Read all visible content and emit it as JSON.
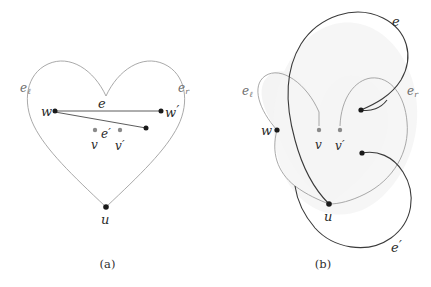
{
  "figure": {
    "type": "mathematical-diagram",
    "background_color": "#ffffff"
  },
  "colors": {
    "heart_curve": "#9a9a9a",
    "dark_curve": "#3a3a3a",
    "edge_line": "#4a4a4a",
    "vertex_black": "#1a1a1a",
    "vertex_gray": "#8a8a8a",
    "shaded_region": "#f4f4f4",
    "label_text": "#2b2b2b",
    "label_gray": "#6e6e6e",
    "caption_text": "#303030"
  },
  "panels": [
    {
      "id": "a",
      "caption": "(a)",
      "vertices": [
        {
          "name": "w",
          "label": "w",
          "sub": "",
          "prime": false,
          "color": "black",
          "x": 55,
          "y": 111
        },
        {
          "name": "w-prime",
          "label": "w",
          "sub": "",
          "prime": true,
          "color": "black",
          "x": 161,
          "y": 111
        },
        {
          "name": "v",
          "label": "v",
          "sub": "",
          "prime": false,
          "color": "gray",
          "x": 95,
          "y": 130
        },
        {
          "name": "v-prime",
          "label": "v",
          "sub": "",
          "prime": true,
          "color": "gray",
          "x": 120,
          "y": 130
        },
        {
          "name": "u",
          "label": "u",
          "sub": "",
          "prime": false,
          "color": "black",
          "x": 106,
          "y": 207
        },
        {
          "name": "e-prime-endpoint",
          "label": "",
          "sub": "",
          "prime": false,
          "color": "black",
          "x": 146,
          "y": 128
        }
      ],
      "edges": [
        {
          "name": "e",
          "label": "e",
          "prime": false,
          "from": "w",
          "to": "w-prime"
        },
        {
          "name": "e-prime",
          "label": "e",
          "prime": true,
          "from": "w",
          "to": "e-prime-endpoint"
        }
      ],
      "labels": [
        {
          "name": "label-e-left",
          "text": "e",
          "sub": "ℓ",
          "prime": false,
          "x": 20,
          "y": 82,
          "gray": true
        },
        {
          "name": "label-e-right",
          "text": "e",
          "sub": "r",
          "prime": false,
          "x": 178,
          "y": 82,
          "gray": true
        },
        {
          "name": "label-e",
          "text": "e",
          "sub": "",
          "prime": false,
          "x": 98,
          "y": 97,
          "gray": false
        },
        {
          "name": "label-e-prime",
          "text": "e",
          "sub": "",
          "prime": true,
          "x": 101,
          "y": 127,
          "gray": false
        },
        {
          "name": "label-w",
          "text": "w",
          "sub": "",
          "prime": false,
          "x": 41,
          "y": 105,
          "gray": false
        },
        {
          "name": "label-w-prime",
          "text": "w",
          "sub": "",
          "prime": true,
          "x": 165,
          "y": 105,
          "gray": false
        },
        {
          "name": "label-v",
          "text": "v",
          "sub": "",
          "prime": false,
          "x": 91,
          "y": 139,
          "gray": false
        },
        {
          "name": "label-v-prime",
          "text": "v",
          "sub": "",
          "prime": true,
          "x": 115,
          "y": 139,
          "gray": false
        },
        {
          "name": "label-u",
          "text": "u",
          "sub": "",
          "prime": false,
          "x": 101,
          "y": 213,
          "gray": false
        }
      ]
    },
    {
      "id": "b",
      "caption": "(b)",
      "vertices": [
        {
          "name": "w",
          "label": "w",
          "sub": "",
          "prime": false,
          "color": "black",
          "x": 62,
          "y": 130
        },
        {
          "name": "v",
          "label": "v",
          "sub": "",
          "prime": false,
          "color": "gray",
          "x": 104,
          "y": 130
        },
        {
          "name": "v-prime",
          "label": "v",
          "sub": "",
          "prime": true,
          "color": "gray",
          "x": 125,
          "y": 130
        },
        {
          "name": "u",
          "label": "u",
          "sub": "",
          "prime": false,
          "color": "black",
          "x": 114,
          "y": 204
        },
        {
          "name": "e-endpoint",
          "label": "",
          "sub": "",
          "prime": false,
          "color": "black",
          "x": 146,
          "y": 110
        },
        {
          "name": "e-prime-endpoint",
          "label": "",
          "sub": "",
          "prime": false,
          "color": "black",
          "x": 147,
          "y": 153
        }
      ],
      "labels": [
        {
          "name": "label-e-left",
          "text": "e",
          "sub": "ℓ",
          "prime": false,
          "x": 27,
          "y": 85,
          "gray": true
        },
        {
          "name": "label-e-right",
          "text": "e",
          "sub": "r",
          "prime": false,
          "x": 192,
          "y": 85,
          "gray": true
        },
        {
          "name": "label-e",
          "text": "e",
          "sub": "",
          "prime": false,
          "x": 177,
          "y": 15,
          "gray": false
        },
        {
          "name": "label-e-prime",
          "text": "e",
          "sub": "",
          "prime": true,
          "x": 176,
          "y": 240,
          "gray": false
        },
        {
          "name": "label-w",
          "text": "w",
          "sub": "",
          "prime": false,
          "x": 46,
          "y": 124,
          "gray": false
        },
        {
          "name": "label-v",
          "text": "v",
          "sub": "",
          "prime": false,
          "x": 100,
          "y": 139,
          "gray": false
        },
        {
          "name": "label-v-prime",
          "text": "v",
          "sub": "",
          "prime": true,
          "x": 120,
          "y": 139,
          "gray": false
        },
        {
          "name": "label-u",
          "text": "u",
          "sub": "",
          "prime": false,
          "x": 109,
          "y": 210,
          "gray": false
        }
      ]
    }
  ]
}
